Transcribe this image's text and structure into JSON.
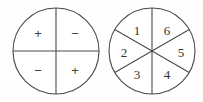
{
  "figure": {
    "background_color": "#fefefe",
    "line_color": "#4a4a4a",
    "text_color": "#333333"
  },
  "spinners": [
    {
      "name": "sign-spinner",
      "cx": 56,
      "cy": 51,
      "r": 43,
      "sector_count": 4,
      "divider_style": "cross",
      "sectors": [
        {
          "position": "top-left",
          "label": "+",
          "lx": 38,
          "ly": 33
        },
        {
          "position": "top-right",
          "label": "−",
          "lx": 75,
          "ly": 33
        },
        {
          "position": "bottom-left",
          "label": "−",
          "lx": 38,
          "ly": 70
        },
        {
          "position": "bottom-right",
          "label": "+",
          "lx": 75,
          "ly": 70
        }
      ]
    },
    {
      "name": "number-spinner",
      "cx": 152,
      "cy": 51,
      "r": 43,
      "sector_count": 6,
      "divider_style": "six-sector",
      "sectors": [
        {
          "position": "upper-left",
          "label": "1",
          "lx": 137,
          "ly": 30
        },
        {
          "position": "upper-right",
          "label": "6",
          "lx": 167,
          "ly": 30
        },
        {
          "position": "left",
          "label": "2",
          "lx": 124,
          "ly": 52
        },
        {
          "position": "right",
          "label": "5",
          "lx": 181,
          "ly": 52
        },
        {
          "position": "lower-left",
          "label": "3",
          "lx": 137,
          "ly": 74
        },
        {
          "position": "lower-right",
          "label": "4",
          "lx": 167,
          "ly": 74
        }
      ]
    }
  ]
}
